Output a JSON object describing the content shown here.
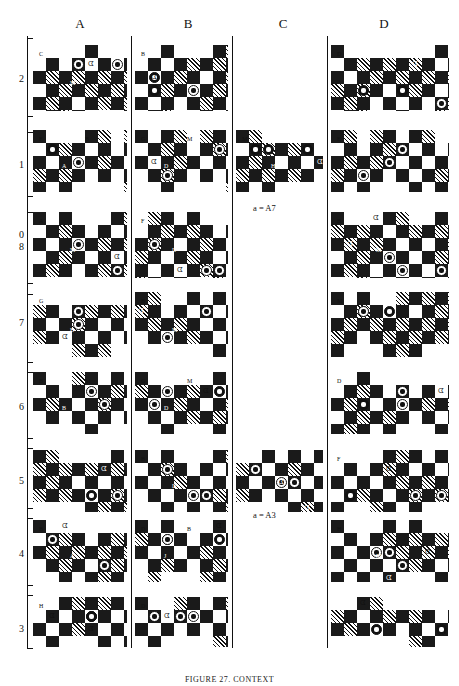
{
  "figure": {
    "caption": "FIGURE 27. CONTEXT",
    "columns": [
      "A",
      "B",
      "C",
      "D"
    ],
    "rows": [
      "2",
      "1",
      "0",
      "8",
      "7",
      "6",
      "5",
      "4",
      "3"
    ],
    "notes": [
      {
        "text": "a = A7"
      },
      {
        "text": "a = A3"
      }
    ]
  },
  "grid": {
    "cells": [
      {
        "row": "2",
        "col": "A",
        "annos": [
          "C",
          "M"
        ],
        "present": true
      },
      {
        "row": "2",
        "col": "B",
        "annos": [
          "B"
        ],
        "present": true
      },
      {
        "row": "2",
        "col": "C",
        "annos": [],
        "present": false
      },
      {
        "row": "2",
        "col": "D",
        "annos": [
          "D"
        ],
        "present": true
      },
      {
        "row": "1",
        "col": "A",
        "annos": [
          "F",
          "A",
          "B"
        ],
        "present": true
      },
      {
        "row": "1",
        "col": "B",
        "annos": [
          "G",
          "D",
          "M"
        ],
        "present": true
      },
      {
        "row": "1",
        "col": "C",
        "annos": [
          "M",
          "H"
        ],
        "present": true
      },
      {
        "row": "1",
        "col": "D",
        "annos": [
          "E"
        ],
        "present": true
      },
      {
        "row": "0",
        "col": "A",
        "annos": [
          "A",
          "M"
        ],
        "present": true
      },
      {
        "row": "0",
        "col": "B",
        "annos": [
          "F",
          "D"
        ],
        "present": true
      },
      {
        "row": "0",
        "col": "C",
        "annos": [],
        "present": false
      },
      {
        "row": "0",
        "col": "D",
        "annos": [
          "B",
          "M"
        ],
        "present": true
      },
      {
        "row": "7",
        "col": "A",
        "annos": [
          "G",
          "B"
        ],
        "present": true
      },
      {
        "row": "7",
        "col": "B",
        "annos": [
          "B",
          "M"
        ],
        "present": true
      },
      {
        "row": "7",
        "col": "C",
        "annos": [],
        "present": false
      },
      {
        "row": "7",
        "col": "D",
        "annos": [
          "M"
        ],
        "present": true
      },
      {
        "row": "6",
        "col": "A",
        "annos": [
          "B",
          "B",
          "M"
        ],
        "present": true
      },
      {
        "row": "6",
        "col": "B",
        "annos": [
          "G",
          "D",
          "M"
        ],
        "present": true
      },
      {
        "row": "6",
        "col": "C",
        "annos": [],
        "present": false
      },
      {
        "row": "6",
        "col": "D",
        "annos": [
          "D",
          "A"
        ],
        "present": true
      },
      {
        "row": "5",
        "col": "A",
        "annos": [],
        "present": true
      },
      {
        "row": "5",
        "col": "B",
        "annos": [
          "B",
          "D"
        ],
        "present": true
      },
      {
        "row": "5",
        "col": "C",
        "annos": [],
        "present": true
      },
      {
        "row": "5",
        "col": "D",
        "annos": [
          "F"
        ],
        "present": true
      },
      {
        "row": "4",
        "col": "A",
        "annos": [
          "B",
          "A"
        ],
        "present": true
      },
      {
        "row": "4",
        "col": "B",
        "annos": [
          "D",
          "J",
          "B"
        ],
        "present": true
      },
      {
        "row": "4",
        "col": "C",
        "annos": [],
        "present": false
      },
      {
        "row": "4",
        "col": "D",
        "annos": [
          "H",
          "M"
        ],
        "present": true
      },
      {
        "row": "3",
        "col": "A",
        "annos": [
          "H"
        ],
        "present": true
      },
      {
        "row": "3",
        "col": "B",
        "annos": [
          "D"
        ],
        "present": true
      },
      {
        "row": "3",
        "col": "C",
        "annos": [],
        "present": false
      },
      {
        "row": "3",
        "col": "D",
        "annos": [],
        "present": true
      }
    ]
  },
  "legend": {
    "white_piece": "white-stone",
    "black_piece": "black-stone",
    "dark_square": "#1a1a1a",
    "hatch_square": "diagonal-hatch",
    "light_square": "#ffffff"
  }
}
